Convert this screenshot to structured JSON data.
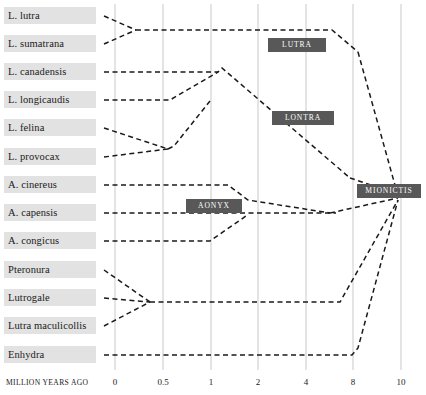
{
  "figure": {
    "axis_caption": "MILLION YEARS AGO",
    "axis_ticks": [
      {
        "label": "0",
        "value": 0,
        "x": 115
      },
      {
        "label": "0.5",
        "value": 0.5,
        "x": 163
      },
      {
        "label": "1",
        "value": 1,
        "x": 211
      },
      {
        "label": "2",
        "value": 2,
        "x": 258
      },
      {
        "label": "4",
        "value": 4,
        "x": 306
      },
      {
        "label": "8",
        "value": 8,
        "x": 353
      },
      {
        "label": "10",
        "value": 10,
        "x": 401
      }
    ],
    "taxa": [
      {
        "name": "L. lutra",
        "y": 16
      },
      {
        "name": "L. sumatrana",
        "y": 44
      },
      {
        "name": "L. canadensis",
        "y": 72
      },
      {
        "name": "L. longicaudis",
        "y": 100
      },
      {
        "name": "L. felina",
        "y": 128
      },
      {
        "name": "L. provocax",
        "y": 157
      },
      {
        "name": "A. cinereus",
        "y": 185
      },
      {
        "name": "A. capensis",
        "y": 213
      },
      {
        "name": "A. congicus",
        "y": 241
      },
      {
        "name": "Pteronura",
        "y": 270
      },
      {
        "name": "Lutrogale",
        "y": 298
      },
      {
        "name": "Lutra maculicollis",
        "y": 326
      },
      {
        "name": "Enhydra",
        "y": 355
      }
    ],
    "clades": [
      {
        "label": "LUTRA",
        "x": 268,
        "y": 38,
        "w": 58
      },
      {
        "label": "LONTRA",
        "x": 272,
        "y": 111,
        "w": 62
      },
      {
        "label": "AONYX",
        "x": 186,
        "y": 199,
        "w": 56
      },
      {
        "label": "MIONICTIS",
        "x": 357,
        "y": 184,
        "w": 64
      }
    ],
    "colors": {
      "badge_fill": "#575857",
      "badge_text": "#ffffff",
      "label_band": "#e2e2e2",
      "gridline": "#c9c9c9",
      "branch": "#1a1a1a"
    },
    "branches": [
      {
        "id": "br-l-lutra",
        "points": "104,16 136,30"
      },
      {
        "id": "br-l-sumatrana",
        "points": "104,44 136,30"
      },
      {
        "id": "br-lutra-stem",
        "points": "136,30 332,30 358,52"
      },
      {
        "id": "br-l-canadensis",
        "points": "104,72 218,72 222,68 350,178"
      },
      {
        "id": "br-l-longicaudis",
        "points": "104,100 170,100 218,72"
      },
      {
        "id": "br-l-felina",
        "points": "104,128 168,149"
      },
      {
        "id": "br-l-provocax",
        "points": "104,157 168,149"
      },
      {
        "id": "br-lontra-stem",
        "points": "168,149 174,146 210,101"
      },
      {
        "id": "br-a-cinereus",
        "points": "104,185 228,185 248,200 330,213"
      },
      {
        "id": "br-a-capensis",
        "points": "104,213 336,213"
      },
      {
        "id": "br-a-congicus",
        "points": "104,241 210,241 246,216"
      },
      {
        "id": "br-pteronura",
        "points": "104,270 150,302"
      },
      {
        "id": "br-lutrogale",
        "points": "104,298 150,302"
      },
      {
        "id": "br-maculicollis",
        "points": "104,326 150,302"
      },
      {
        "id": "br-lower-stem",
        "points": "150,302 340,302 398,200"
      },
      {
        "id": "br-enhydra",
        "points": "104,355 352,355 358,348 398,200"
      },
      {
        "id": "br-aonyx-join",
        "points": "330,213 398,198"
      },
      {
        "id": "br-lutra-to-root",
        "points": "358,52 398,196"
      },
      {
        "id": "br-lontra-to-root",
        "points": "350,178 398,194"
      }
    ],
    "root": {
      "x": 398,
      "y": 196
    }
  }
}
